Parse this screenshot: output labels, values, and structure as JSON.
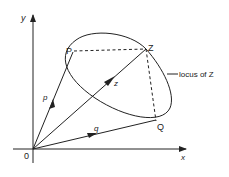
{
  "diagram": {
    "title": "",
    "axes": {
      "x_label": "x",
      "y_label": "y",
      "origin_label": "0"
    },
    "points": {
      "P": "P",
      "Q": "Q",
      "Z": "Z"
    },
    "vectors": {
      "p": "p",
      "q": "q",
      "z": "z"
    },
    "annotation": "locus of Z",
    "colors": {
      "line": "#222222",
      "background": "#ffffff"
    }
  }
}
